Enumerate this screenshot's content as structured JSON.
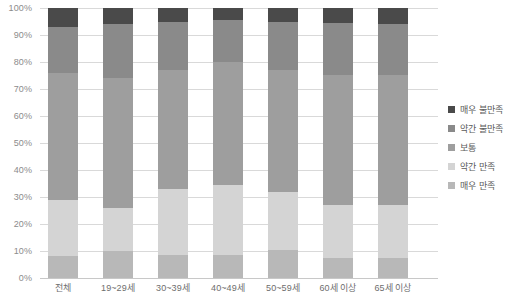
{
  "chart_data": {
    "type": "bar",
    "subtype": "stacked-100-percent",
    "title": "",
    "subtitle": "",
    "xlabel": "",
    "ylabel": "",
    "ylim": [
      0,
      100
    ],
    "ytick_labels": [
      "0%",
      "10%",
      "20%",
      "30%",
      "40%",
      "50%",
      "60%",
      "70%",
      "80%",
      "90%",
      "100%"
    ],
    "ytick_values": [
      0,
      10,
      20,
      30,
      40,
      50,
      60,
      70,
      80,
      90,
      100
    ],
    "grid": true,
    "legend_position": "right",
    "categories": [
      "전체",
      "19~29세",
      "30~39세",
      "40~49세",
      "50~59세",
      "60세 이상",
      "65세 이상"
    ],
    "series": [
      {
        "name": "매우 불만족",
        "color": "#4a4a4a",
        "values": [
          7.0,
          6.0,
          5.0,
          4.5,
          5.0,
          5.5,
          6.0
        ]
      },
      {
        "name": "약간 불만족",
        "color": "#8a8a8a",
        "values": [
          17.0,
          20.0,
          18.0,
          15.5,
          18.0,
          19.5,
          19.0
        ]
      },
      {
        "name": "보통",
        "color": "#9e9e9e",
        "values": [
          47.0,
          48.0,
          44.0,
          45.5,
          45.0,
          48.0,
          48.0
        ]
      },
      {
        "name": "약간 만족",
        "color": "#d4d4d4",
        "values": [
          21.0,
          16.0,
          24.5,
          26.0,
          21.5,
          19.5,
          19.5
        ]
      },
      {
        "name": "매우 만족",
        "color": "#b8b8b8",
        "values": [
          8.0,
          10.0,
          8.5,
          8.5,
          10.5,
          7.5,
          7.5
        ]
      }
    ]
  },
  "legend": {
    "items": [
      {
        "label": "매우 불만족",
        "color": "#4a4a4a"
      },
      {
        "label": "약간 불만족",
        "color": "#8a8a8a"
      },
      {
        "label": "보통",
        "color": "#9e9e9e"
      },
      {
        "label": "약간 만족",
        "color": "#d4d4d4"
      },
      {
        "label": "매우 만족",
        "color": "#b8b8b8"
      }
    ]
  }
}
